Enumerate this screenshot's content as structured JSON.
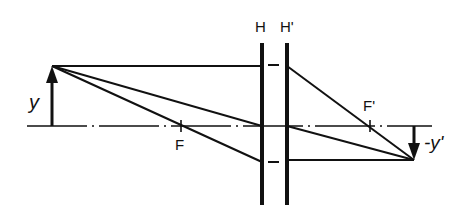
{
  "diagram": {
    "type": "optics-ray-diagram",
    "colors": {
      "line": "#111111",
      "background": "#ffffff"
    },
    "labels": {
      "principal_plane_object": "H",
      "principal_plane_image": "H'",
      "object_height": "y",
      "image_height": "-y'",
      "focal_point_object": "F",
      "focal_point_image": "F'"
    },
    "geometry": {
      "optical_axis_y": 126,
      "axis_x_start": 27,
      "axis_x_end": 432,
      "plane_H_x": 262,
      "plane_H_prime_x": 287,
      "plane_top_y": 43,
      "plane_bottom_y": 205,
      "object_x": 52,
      "object_tip_y": 66,
      "image_x": 414,
      "image_tip_y": 160,
      "F_x": 181,
      "F_prime_x": 370
    }
  }
}
